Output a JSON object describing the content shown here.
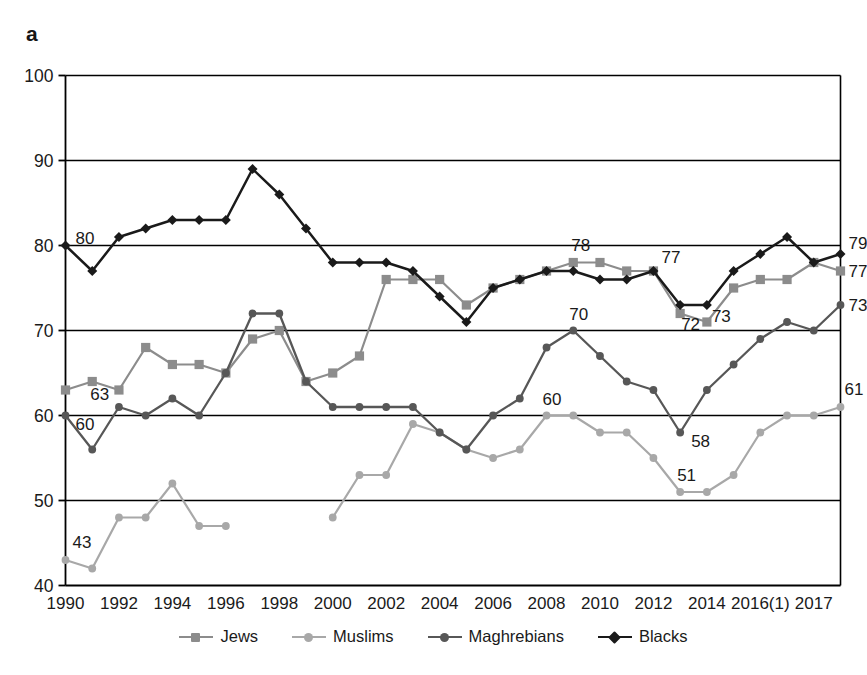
{
  "panel": {
    "letter": "a"
  },
  "colors": {
    "jews": "#8c8c8c",
    "muslims": "#a8a8a8",
    "maghrebians": "#575757",
    "blacks": "#1a1a1a",
    "axis": "#000000",
    "grid": "#000000",
    "text": "#1a1a1a",
    "background": "#ffffff"
  },
  "legend": {
    "position": "bottom",
    "items": [
      {
        "label": "Jews",
        "color": "#8c8c8c",
        "marker": "square"
      },
      {
        "label": "Muslims",
        "color": "#a8a8a8",
        "marker": "circle"
      },
      {
        "label": "Maghrebians",
        "color": "#575757",
        "marker": "circle"
      },
      {
        "label": "Blacks",
        "color": "#1a1a1a",
        "marker": "diamond"
      }
    ]
  },
  "chart_data": {
    "type": "line",
    "title": "",
    "subtitle": "",
    "xlabel": "",
    "ylabel": "",
    "ylim": [
      40,
      100
    ],
    "yticks": [
      40,
      50,
      60,
      70,
      80,
      90,
      100
    ],
    "grid": true,
    "grid_axis": "y",
    "legend_position": "bottom",
    "x": [
      1990,
      1991,
      1992,
      1993,
      1994,
      1995,
      1996,
      1997,
      1998,
      1999,
      2000,
      2001,
      2002,
      2003,
      2004,
      2005,
      2006,
      2007,
      2008,
      2009,
      2010,
      2011,
      2012,
      2013,
      2014,
      2015,
      "2016(1)",
      "2016b",
      2017,
      "2017b"
    ],
    "xtick_labels": [
      "1990",
      "1992",
      "1994",
      "1996",
      "1998",
      "2000",
      "2002",
      "2004",
      "2006",
      "2008",
      "2010",
      "2012",
      "2014",
      "2016(1)",
      "2017"
    ],
    "xtick_indices": [
      0,
      2,
      4,
      6,
      8,
      10,
      12,
      14,
      16,
      18,
      20,
      22,
      24,
      26,
      28
    ],
    "series": [
      {
        "name": "Jews",
        "color": "#8c8c8c",
        "marker": "square",
        "values": [
          63,
          64,
          63,
          68,
          66,
          66,
          65,
          69,
          70,
          64,
          65,
          67,
          76,
          76,
          76,
          73,
          75,
          76,
          77,
          78,
          78,
          77,
          77,
          72,
          71,
          75,
          76,
          76,
          78,
          77
        ]
      },
      {
        "name": "Muslims",
        "color": "#a8a8a8",
        "marker": "circle",
        "values": [
          43,
          42,
          48,
          48,
          52,
          47,
          47,
          null,
          null,
          null,
          48,
          53,
          53,
          59,
          58,
          56,
          55,
          56,
          60,
          60,
          58,
          58,
          55,
          51,
          51,
          53,
          58,
          60,
          60,
          61
        ]
      },
      {
        "name": "Maghrebians",
        "color": "#575757",
        "marker": "circle",
        "values": [
          60,
          56,
          61,
          60,
          62,
          60,
          65,
          72,
          72,
          64,
          61,
          61,
          61,
          61,
          58,
          56,
          60,
          62,
          68,
          70,
          67,
          64,
          63,
          58,
          63,
          66,
          69,
          71,
          70,
          73
        ]
      },
      {
        "name": "Blacks",
        "color": "#1a1a1a",
        "marker": "diamond",
        "values": [
          80,
          77,
          81,
          82,
          83,
          83,
          83,
          89,
          86,
          82,
          78,
          78,
          78,
          77,
          74,
          71,
          75,
          76,
          77,
          77,
          76,
          76,
          77,
          73,
          73,
          77,
          79,
          81,
          78,
          79
        ]
      }
    ],
    "point_labels": [
      {
        "text": "80",
        "series": "Blacks",
        "index": 0,
        "value": 80,
        "dx": 10,
        "dy": -2
      },
      {
        "text": "63",
        "series": "Jews",
        "index": 1,
        "value": 64,
        "dx": -2,
        "dy": 18
      },
      {
        "text": "60",
        "series": "Maghrebians",
        "index": 0,
        "value": 60,
        "dx": 10,
        "dy": 14
      },
      {
        "text": "43",
        "series": "Muslims",
        "index": 0,
        "value": 43,
        "dx": 7,
        "dy": -12
      },
      {
        "text": "78",
        "series": "Jews",
        "index": 19,
        "value": 78,
        "dx": -2,
        "dy": -12
      },
      {
        "text": "77",
        "series": "Blacks",
        "index": 22,
        "value": 77,
        "dx": 8,
        "dy": -8
      },
      {
        "text": "72",
        "series": "Jews",
        "index": 23,
        "value": 72,
        "dx": 1,
        "dy": 16
      },
      {
        "text": "73",
        "series": "Blacks",
        "index": 24,
        "value": 73,
        "dx": 5,
        "dy": 17
      },
      {
        "text": "70",
        "series": "Maghrebians",
        "index": 19,
        "value": 70,
        "dx": -4,
        "dy": -11
      },
      {
        "text": "60",
        "series": "Muslims",
        "index": 18,
        "value": 60,
        "dx": -4,
        "dy": -11
      },
      {
        "text": "58",
        "series": "Maghrebians",
        "index": 23,
        "value": 58,
        "dx": 11,
        "dy": 14
      },
      {
        "text": "51",
        "series": "Muslims",
        "index": 23,
        "value": 51,
        "dx": -3,
        "dy": -11
      },
      {
        "text": "79",
        "series": "Blacks",
        "index": 29,
        "value": 79,
        "dx": 8,
        "dy": -5
      },
      {
        "text": "77",
        "series": "Jews",
        "index": 29,
        "value": 77,
        "dx": 8,
        "dy": 6
      },
      {
        "text": "73",
        "series": "Maghrebians",
        "index": 29,
        "value": 73,
        "dx": 8,
        "dy": 6
      },
      {
        "text": "61",
        "series": "Muslims",
        "index": 29,
        "value": 61,
        "dx": 4,
        "dy": -12
      }
    ]
  }
}
